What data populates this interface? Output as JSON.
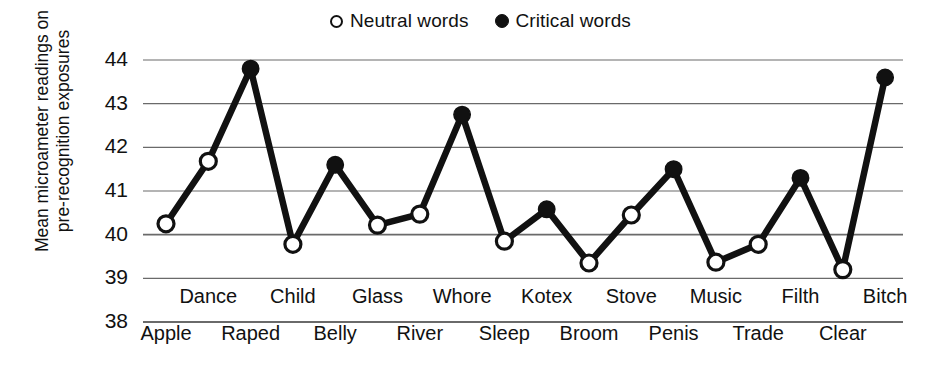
{
  "legend": {
    "position": "top-center",
    "entries": [
      {
        "label": "Neutral words",
        "marker": "open-circle-icon",
        "color": "#ffffff"
      },
      {
        "label": "Critical words",
        "marker": "filled-circle-icon",
        "color": "#111111"
      }
    ]
  },
  "axes": {
    "ylabel_line1": "Mean microameter readings on",
    "ylabel_line2": "pre-recognition exposures",
    "ytick_labels": [
      "44",
      "43",
      "42",
      "41",
      "40",
      "39",
      "38"
    ]
  },
  "chart_data": {
    "type": "line",
    "title": "",
    "xlabel": "",
    "ylabel": "Mean microameter readings on pre-recognition exposures",
    "ylim": [
      38,
      44
    ],
    "yticks": [
      38,
      39,
      40,
      41,
      42,
      43,
      44
    ],
    "grid": true,
    "legend_position": "top-center",
    "categories": [
      "Apple",
      "Dance",
      "Raped",
      "Child",
      "Belly",
      "Glass",
      "River",
      "Whore",
      "Sleep",
      "Kotex",
      "Broom",
      "Stove",
      "Penis",
      "Music",
      "Trade",
      "Filth",
      "Clear",
      "Bitch"
    ],
    "values": [
      40.25,
      41.68,
      43.8,
      39.78,
      41.6,
      40.22,
      40.47,
      42.75,
      39.85,
      40.58,
      39.35,
      40.45,
      41.5,
      39.37,
      39.78,
      41.3,
      39.2,
      43.6
    ],
    "point_types": [
      "neutral",
      "neutral",
      "critical",
      "neutral",
      "critical",
      "neutral",
      "neutral",
      "critical",
      "neutral",
      "critical",
      "neutral",
      "neutral",
      "critical",
      "neutral",
      "neutral",
      "critical",
      "neutral",
      "critical"
    ],
    "series": [
      {
        "name": "Neutral words",
        "points": [
          {
            "category": "Apple",
            "value": 40.25
          },
          {
            "category": "Dance",
            "value": 41.68
          },
          {
            "category": "Child",
            "value": 39.78
          },
          {
            "category": "Glass",
            "value": 40.22
          },
          {
            "category": "River",
            "value": 40.47
          },
          {
            "category": "Sleep",
            "value": 39.85
          },
          {
            "category": "Broom",
            "value": 39.35
          },
          {
            "category": "Stove",
            "value": 40.45
          },
          {
            "category": "Music",
            "value": 39.37
          },
          {
            "category": "Trade",
            "value": 39.78
          },
          {
            "category": "Clear",
            "value": 39.2
          }
        ]
      },
      {
        "name": "Critical words",
        "points": [
          {
            "category": "Raped",
            "value": 43.8
          },
          {
            "category": "Belly",
            "value": 41.6
          },
          {
            "category": "Whore",
            "value": 42.75
          },
          {
            "category": "Kotex",
            "value": 40.58
          },
          {
            "category": "Penis",
            "value": 41.5
          },
          {
            "category": "Filth",
            "value": 41.3
          },
          {
            "category": "Bitch",
            "value": 43.6
          }
        ]
      }
    ],
    "xaxis_rows": {
      "upper": [
        "Dance",
        "Child",
        "Glass",
        "Whore",
        "Kotex",
        "Stove",
        "Music",
        "Filth",
        "Bitch"
      ],
      "lower": [
        "Apple",
        "Raped",
        "Belly",
        "River",
        "Sleep",
        "Broom",
        "Penis",
        "Trade",
        "Clear"
      ]
    }
  },
  "colors": {
    "line": "#111111",
    "grid": "#6a6a6a",
    "background": "#ffffff",
    "marker_fill_critical": "#111111",
    "marker_fill_neutral": "#ffffff"
  }
}
